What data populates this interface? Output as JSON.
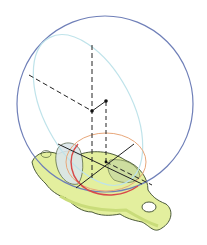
{
  "diagram": {
    "colors": {
      "background": "#ffffff",
      "sphere_outline": "#6f7fb8",
      "sphere_inner_ellipse": "#bfe3ea",
      "bone_fill": "#e3ef9e",
      "bone_shadow": "#c9dc7a",
      "bone_outline": "#3a4a2a",
      "acetabulum_fill": "#dbe6ea",
      "red_arc": "#d84a4a",
      "orange_ellipse": "#e8a77a",
      "axis_lines": "#222222"
    }
  }
}
